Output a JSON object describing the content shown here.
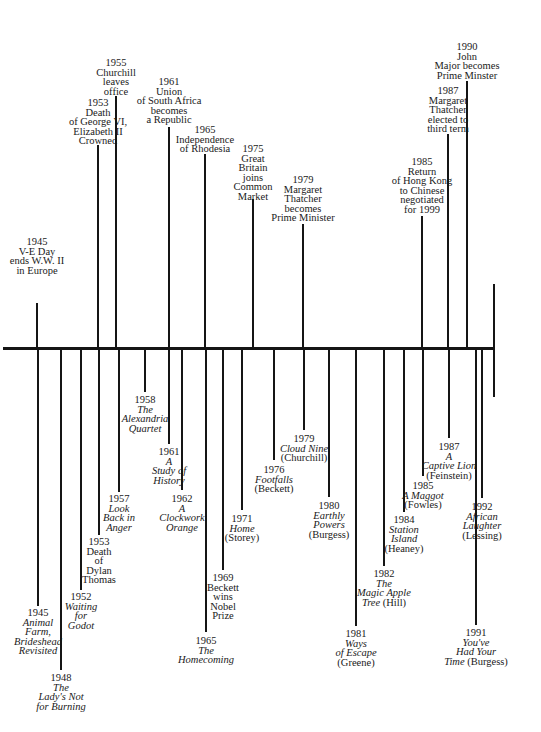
{
  "chart_data": {
    "type": "timeline",
    "title": "",
    "axis": {
      "y": 348,
      "x_start": 3,
      "x_end": 495
    },
    "events_above": [
      {
        "year": "1945",
        "lines": [
          "V-E Day",
          "ends W.W. II",
          "in Europe"
        ],
        "x": 37,
        "tick_top": 303,
        "label_top": 237
      },
      {
        "year": "1953",
        "lines": [
          "Death",
          "of George VI,",
          "Elizabeth II",
          "Crowned"
        ],
        "x": 98,
        "tick_top": 145,
        "label_top": 98
      },
      {
        "year": "1955",
        "lines": [
          "Churchill",
          "leaves",
          "office"
        ],
        "x": 116,
        "tick_top": 96,
        "label_top": 58
      },
      {
        "year": "1961",
        "lines": [
          "Union",
          "of South Africa",
          "becomes",
          "a Republic"
        ],
        "x": 169,
        "tick_top": 127,
        "label_top": 77
      },
      {
        "year": "1965",
        "lines": [
          "Independence",
          "of Rhodesia"
        ],
        "x": 205,
        "tick_top": 154,
        "label_top": 125
      },
      {
        "year": "1975",
        "lines": [
          "Great",
          "Britain",
          "joins",
          "Common",
          "Market"
        ],
        "x": 253,
        "tick_top": 199,
        "label_top": 144
      },
      {
        "year": "1979",
        "lines": [
          "Margaret",
          "Thatcher",
          "becomes",
          "Prime Minister"
        ],
        "x": 303,
        "tick_top": 224,
        "label_top": 175
      },
      {
        "year": "1985",
        "lines": [
          "Return",
          "of Hong Kong",
          "to Chinese",
          "negotiated",
          "for 1999"
        ],
        "x": 422,
        "tick_top": 216,
        "label_top": 157
      },
      {
        "year": "1987",
        "lines": [
          "Margaret",
          "Thatcher",
          "elected to",
          "third term"
        ],
        "x": 448,
        "tick_top": 134,
        "label_top": 86
      },
      {
        "year": "1990",
        "lines": [
          "John",
          "Major becomes",
          "Prime Minster"
        ],
        "x": 467,
        "tick_top": 81,
        "label_top": 42
      }
    ],
    "events_below": [
      {
        "year": "1945",
        "lines": [
          {
            "t": "Animal",
            "i": true
          },
          {
            "t": "Farm,",
            "i": true
          },
          {
            "t": "Brideshead",
            "i": true
          },
          {
            "t": "Revisited",
            "i": true
          }
        ],
        "x": 38,
        "tick_bottom": 606,
        "label_top": 608
      },
      {
        "year": "1948",
        "lines": [
          {
            "t": "The",
            "i": true
          },
          {
            "t": "Lady's Not",
            "i": true
          },
          {
            "t": "for Burning",
            "i": true
          }
        ],
        "x": 61,
        "tick_bottom": 670,
        "label_top": 673
      },
      {
        "year": "1952",
        "lines": [
          {
            "t": "Waiting",
            "i": true
          },
          {
            "t": "for",
            "i": true
          },
          {
            "t": "Godot",
            "i": true
          }
        ],
        "x": 81,
        "tick_bottom": 590,
        "label_top": 592
      },
      {
        "year": "1953",
        "lines": [
          {
            "t": "Death",
            "i": false
          },
          {
            "t": "of",
            "i": false
          },
          {
            "t": "Dylan",
            "i": false
          },
          {
            "t": "Thomas",
            "i": false
          }
        ],
        "x": 99,
        "tick_bottom": 535,
        "label_top": 537
      },
      {
        "year": "1957",
        "lines": [
          {
            "t": "Look",
            "i": true
          },
          {
            "t": "Back in",
            "i": true
          },
          {
            "t": "Anger",
            "i": true
          }
        ],
        "x": 119,
        "tick_bottom": 492,
        "label_top": 494
      },
      {
        "year": "1958",
        "lines": [
          {
            "t": "The",
            "i": true
          },
          {
            "t": "Alexandria",
            "i": true
          },
          {
            "t": "Quartet",
            "i": true
          }
        ],
        "x": 145,
        "tick_bottom": 392,
        "label_top": 395
      },
      {
        "year": "1961",
        "lines": [
          {
            "t": "A",
            "i": true
          },
          {
            "t": "Study of",
            "i": true
          },
          {
            "t": "History",
            "i": true
          }
        ],
        "x": 169,
        "tick_bottom": 444,
        "label_top": 447
      },
      {
        "year": "1962",
        "lines": [
          {
            "t": "A",
            "i": true
          },
          {
            "t": "Clockwork",
            "i": true
          },
          {
            "t": "Orange",
            "i": true
          }
        ],
        "x": 182,
        "tick_bottom": 490,
        "label_top": 494
      },
      {
        "year": "1965",
        "lines": [
          {
            "t": "The",
            "i": true
          },
          {
            "t": "Homecoming",
            "i": true
          }
        ],
        "x": 206,
        "tick_bottom": 632,
        "label_top": 636
      },
      {
        "year": "1969",
        "lines": [
          {
            "t": "Beckett",
            "i": false
          },
          {
            "t": "wins",
            "i": false
          },
          {
            "t": "Nobel",
            "i": false
          },
          {
            "t": "Prize",
            "i": false
          }
        ],
        "x": 223,
        "tick_bottom": 570,
        "label_top": 573
      },
      {
        "year": "1971",
        "lines": [
          {
            "t": "Home",
            "i": true
          },
          {
            "t": "(Storey)",
            "i": false
          }
        ],
        "x": 242,
        "tick_bottom": 510,
        "label_top": 514
      },
      {
        "year": "1976",
        "lines": [
          {
            "t": "Footfalls",
            "i": true
          },
          {
            "t": "(Beckett)",
            "i": false
          }
        ],
        "x": 274,
        "tick_bottom": 460,
        "label_top": 465
      },
      {
        "year": "1979",
        "lines": [
          {
            "t": "Cloud Nine",
            "i": true
          },
          {
            "t": "(Churchill)",
            "i": false
          }
        ],
        "x": 304,
        "tick_bottom": 430,
        "label_top": 434
      },
      {
        "year": "1980",
        "lines": [
          {
            "t": "Earthly",
            "i": true
          },
          {
            "t": "Powers",
            "i": true
          },
          {
            "t": "(Burgess)",
            "i": false
          }
        ],
        "x": 329,
        "tick_bottom": 497,
        "label_top": 501
      },
      {
        "year": "1981",
        "lines": [
          {
            "t": "Ways",
            "i": true
          },
          {
            "t": "of Escape",
            "i": true
          },
          {
            "t": "(Greene)",
            "i": false
          }
        ],
        "x": 356,
        "tick_bottom": 626,
        "label_top": 629
      },
      {
        "year": "1982",
        "lines": [
          {
            "t": "The",
            "i": true
          },
          {
            "t": "Magic Apple",
            "i": true
          },
          {
            "t": "Tree (Hill)",
            "i": false
          }
        ],
        "x": 384,
        "tick_bottom": 566,
        "label_top": 569
      },
      {
        "year": "1984",
        "lines": [
          {
            "t": "Station",
            "i": true
          },
          {
            "t": "Island",
            "i": true
          },
          {
            "t": "(Heaney)",
            "i": false
          }
        ],
        "x": 404,
        "tick_bottom": 512,
        "label_top": 515
      },
      {
        "year": "1985",
        "lines": [
          {
            "t": "A Maggot",
            "i": true
          },
          {
            "t": "(Fowles)",
            "i": false
          }
        ],
        "x": 423,
        "tick_bottom": 476,
        "label_top": 481
      },
      {
        "year": "1987",
        "lines": [
          {
            "t": "A",
            "i": true
          },
          {
            "t": "Captive Lion",
            "i": true
          },
          {
            "t": "(Feinstein)",
            "i": false
          }
        ],
        "x": 449,
        "tick_bottom": 438,
        "label_top": 442
      },
      {
        "year": "1991",
        "lines": [
          {
            "t": "You've",
            "i": true
          },
          {
            "t": "Had Your",
            "i": true
          },
          {
            "t": "Time (Burgess)",
            "i": false
          }
        ],
        "x": 476,
        "tick_bottom": 625,
        "label_top": 628
      },
      {
        "year": "1992",
        "lines": [
          {
            "t": "African",
            "i": true
          },
          {
            "t": "Laughter",
            "i": true
          },
          {
            "t": "(Lessing)",
            "i": false
          }
        ],
        "x": 482,
        "tick_bottom": 498,
        "label_top": 502
      }
    ],
    "end_marker": {
      "x": 494,
      "top": 284,
      "bottom": 397
    }
  }
}
